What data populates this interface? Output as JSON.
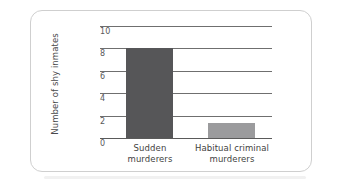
{
  "chart_data": {
    "type": "bar",
    "title": "",
    "xlabel": "",
    "ylabel": "Number of shy inmates",
    "categories": [
      "Sudden murderers",
      "Habitual criminal murderers"
    ],
    "values": [
      8,
      1.3
    ],
    "ylim": [
      0,
      10
    ],
    "yticks": [
      0,
      2,
      4,
      6,
      8,
      10
    ],
    "ytick_labels": [
      "0",
      "2",
      "4",
      "6",
      "8",
      "10"
    ],
    "grid": true,
    "legend": "none",
    "series": [
      {
        "name": "Number of shy inmates",
        "values": [
          8,
          1.3
        ],
        "colors": [
          "#565658",
          "#9b9b9d"
        ]
      }
    ],
    "bar_labels_line1": [
      "Sudden",
      "Habitual criminal"
    ],
    "bar_labels_line2": [
      "murderers",
      "murderers"
    ]
  },
  "colors": {
    "bar_dark": "#565658",
    "bar_light": "#9b9b9d",
    "gridline": "#6f6f6f",
    "frame_border": "#cfcfcf",
    "tick_text": "#58585a",
    "axis_title_text": "#4a4a4c",
    "category_text": "#3f3f41",
    "background": "#ffffff"
  }
}
